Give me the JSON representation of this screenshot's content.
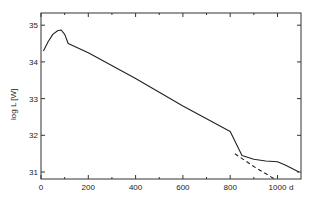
{
  "chart_data": {
    "type": "line",
    "title": "",
    "xlabel": "d",
    "ylabel": "log L [W]",
    "xlim": [
      0,
      1100
    ],
    "ylim": [
      30.8,
      35.3
    ],
    "grid": false,
    "legend": null,
    "x_ticks": [
      0,
      200,
      400,
      600,
      800,
      1000
    ],
    "x_minor_ticks": [
      100,
      300,
      500,
      700,
      900
    ],
    "y_ticks": [
      31,
      32,
      33,
      34,
      35
    ],
    "series": [
      {
        "name": "solid",
        "style": "solid",
        "x": [
          10,
          30,
          50,
          70,
          85,
          100,
          115,
          200,
          400,
          600,
          800,
          850,
          900,
          950,
          1000,
          1030,
          1060,
          1090
        ],
        "y": [
          34.3,
          34.55,
          34.75,
          34.85,
          34.87,
          34.75,
          34.5,
          34.25,
          33.55,
          32.8,
          32.1,
          31.45,
          31.35,
          31.3,
          31.28,
          31.2,
          31.1,
          31.0
        ]
      },
      {
        "name": "dashed-extrapolation",
        "style": "dashed",
        "x": [
          820,
          900,
          990
        ],
        "y": [
          31.5,
          31.15,
          30.8
        ]
      }
    ]
  },
  "axes": {
    "x_label": "d",
    "y_label": "log L [W]",
    "x_tick_labels": [
      "0",
      "200",
      "400",
      "600",
      "800",
      "1000"
    ],
    "y_tick_labels": [
      "31",
      "32",
      "33",
      "34",
      "35"
    ]
  }
}
